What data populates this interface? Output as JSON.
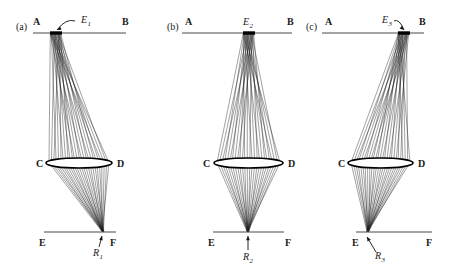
{
  "figure": {
    "background": "#ffffff",
    "ray_color": "#1f1f1f",
    "line_color": "#4a4a4a",
    "width": 452,
    "height": 270
  },
  "geometry": {
    "source_line_y": 33,
    "lens_y": 163,
    "image_line_y": 232,
    "ray_count": 26,
    "emitter_half_width": 6,
    "lens_half_height": 5
  },
  "panels": [
    {
      "id": "a",
      "panel_label": "(a)",
      "panel_label_x": 16,
      "panel_label_y": 30,
      "source_line": {
        "x1": 33,
        "x2": 126
      },
      "image_line": {
        "x1": 44,
        "x2": 116
      },
      "lens": {
        "x1": 46,
        "x2": 112
      },
      "emitter": {
        "x": 56,
        "label": "E",
        "sub": "1",
        "label_x": 81,
        "label_y": 23,
        "arrow": {
          "type": "curve",
          "x1": 75,
          "y1": 21,
          "x2": 57,
          "y2": 30
        }
      },
      "focus": {
        "x": 103,
        "label": "R",
        "sub": "1",
        "label_x": 93,
        "label_y": 256,
        "arrow": {
          "type": "straight",
          "x1": 99,
          "y1": 247,
          "x2": 102,
          "y2": 236
        }
      },
      "labels": {
        "A": {
          "text": "A",
          "x": 33,
          "y": 25
        },
        "B": {
          "text": "B",
          "x": 122,
          "y": 25
        },
        "C": {
          "text": "C",
          "x": 36,
          "y": 167
        },
        "D": {
          "text": "D",
          "x": 117,
          "y": 167
        },
        "E": {
          "text": "E",
          "x": 39,
          "y": 246
        },
        "F": {
          "text": "F",
          "x": 110,
          "y": 246
        }
      }
    },
    {
      "id": "b",
      "panel_label": "(b)",
      "panel_label_x": 167,
      "panel_label_y": 30,
      "source_line": {
        "x1": 182,
        "x2": 292
      },
      "image_line": {
        "x1": 213,
        "x2": 284
      },
      "lens": {
        "x1": 214,
        "x2": 283
      },
      "emitter": {
        "x": 249,
        "label": "E",
        "sub": "2",
        "label_x": 243,
        "label_y": 25,
        "arrow": null
      },
      "focus": {
        "x": 248,
        "label": "R",
        "sub": "2",
        "label_x": 243,
        "label_y": 260,
        "arrow": {
          "type": "straight",
          "x1": 248,
          "y1": 250,
          "x2": 248,
          "y2": 236
        }
      },
      "labels": {
        "A": {
          "text": "A",
          "x": 185,
          "y": 25
        },
        "B": {
          "text": "B",
          "x": 287,
          "y": 25
        },
        "C": {
          "text": "C",
          "x": 203,
          "y": 167
        },
        "D": {
          "text": "D",
          "x": 288,
          "y": 167
        },
        "E": {
          "text": "E",
          "x": 208,
          "y": 246
        },
        "F": {
          "text": "F",
          "x": 285,
          "y": 246
        }
      }
    },
    {
      "id": "c",
      "panel_label": "(c)",
      "panel_label_x": 306,
      "panel_label_y": 30,
      "source_line": {
        "x1": 322,
        "x2": 424
      },
      "image_line": {
        "x1": 356,
        "x2": 432
      },
      "lens": {
        "x1": 348,
        "x2": 413
      },
      "emitter": {
        "x": 404,
        "label": "E",
        "sub": "3",
        "label_x": 382,
        "label_y": 23,
        "arrow": {
          "type": "curve",
          "x1": 394,
          "y1": 21,
          "x2": 404,
          "y2": 30
        }
      },
      "focus": {
        "x": 368,
        "label": "R",
        "sub": "3",
        "label_x": 375,
        "label_y": 259,
        "arrow": {
          "type": "straight",
          "x1": 376,
          "y1": 252,
          "x2": 367,
          "y2": 237
        }
      },
      "labels": {
        "A": {
          "text": "A",
          "x": 325,
          "y": 25
        },
        "B": {
          "text": "B",
          "x": 419,
          "y": 25
        },
        "C": {
          "text": "C",
          "x": 338,
          "y": 167
        },
        "D": {
          "text": "D",
          "x": 418,
          "y": 167
        },
        "E": {
          "text": "E",
          "x": 352,
          "y": 246
        },
        "F": {
          "text": "F",
          "x": 426,
          "y": 246
        }
      }
    }
  ]
}
